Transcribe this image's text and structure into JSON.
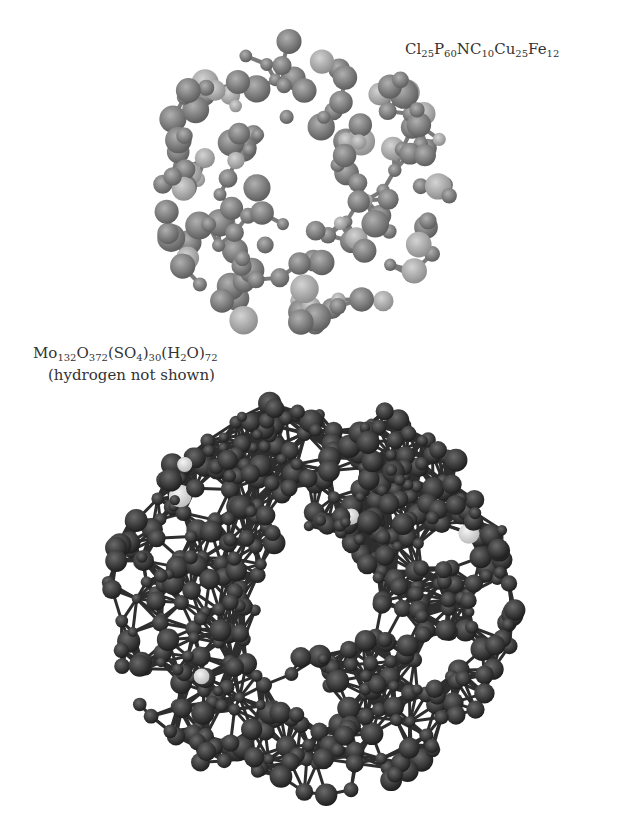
{
  "figure": {
    "molecules": [
      {
        "id": "top",
        "formula_parts": [
          [
            "Cl",
            "25"
          ],
          [
            "P",
            "60"
          ],
          [
            "N",
            ""
          ],
          [
            "C",
            "10"
          ],
          [
            "Cu",
            "25"
          ],
          [
            "Fe",
            "12"
          ]
        ],
        "formula_text": "Cl25P60NC10Cu25Fe12",
        "color": "#8a8a8a",
        "center": [
          300,
          185
        ],
        "radius": 150
      },
      {
        "id": "bottom",
        "formula_parts": [
          [
            "Mo",
            "132"
          ],
          [
            "O",
            "372"
          ],
          [
            "(SO",
            ""
          ],
          [
            "",
            "4"
          ],
          [
            ")",
            "30"
          ],
          [
            "(H",
            ""
          ],
          [
            "",
            "2"
          ],
          [
            "O)",
            "72"
          ]
        ],
        "formula_text": "Mo132O372(SO4)30(H2O)72",
        "note": "(hydrogen not shown)",
        "color": "#3a3a3a",
        "center": [
          312,
          598
        ],
        "radius": 205
      }
    ]
  }
}
